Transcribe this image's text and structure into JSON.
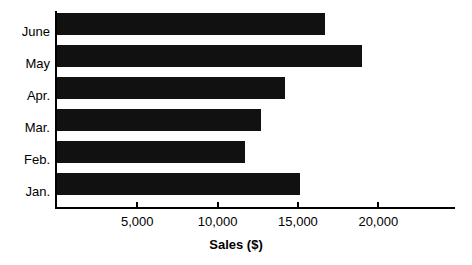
{
  "chart_data": {
    "type": "bar",
    "orientation": "horizontal",
    "title": "",
    "subtitle": "",
    "xlabel": "Sales ($)",
    "ylabel": "",
    "categories": [
      "June",
      "May",
      "Apr.",
      "Mar.",
      "Feb.",
      "Jan."
    ],
    "values": [
      16700,
      19000,
      14200,
      12700,
      11700,
      15100
    ],
    "series": [
      {
        "name": "Sales",
        "values": [
          16700,
          19000,
          14200,
          12700,
          11700,
          15100
        ]
      }
    ],
    "xlim": [
      0,
      24900
    ],
    "ylim": [
      0,
      6
    ],
    "xticks": [
      5000,
      10000,
      15000,
      20000
    ],
    "xtick_labels": [
      "5,000",
      "10,000",
      "15,000",
      "20,000"
    ],
    "ytick_labels": [
      "June",
      "May",
      "Apr.",
      "Mar.",
      "Feb.",
      "Jan."
    ],
    "grid": false,
    "legend": false,
    "legend_position": "none",
    "bar_color": "#111111",
    "background_color": "#ffffff",
    "axis_color": "#000000"
  },
  "axis": {
    "x_title": "Sales ($)",
    "ticks": [
      {
        "label": "5,000",
        "value": 5000
      },
      {
        "label": "10,000",
        "value": 10000
      },
      {
        "label": "15,000",
        "value": 15000
      },
      {
        "label": "20,000",
        "value": 20000
      }
    ]
  },
  "bars": [
    {
      "label": "June",
      "value": 16700
    },
    {
      "label": "May",
      "value": 19000
    },
    {
      "label": "Apr.",
      "value": 14200
    },
    {
      "label": "Mar.",
      "value": 12700
    },
    {
      "label": "Feb.",
      "value": 11700
    },
    {
      "label": "Jan.",
      "value": 15100
    }
  ]
}
